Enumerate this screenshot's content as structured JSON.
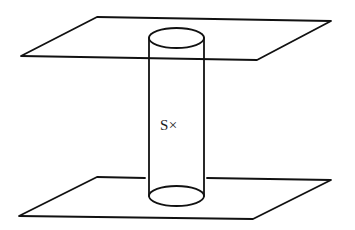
{
  "diagram": {
    "type": "geometric-illustration",
    "label": "S×",
    "stroke_color": "#111111",
    "background": "#ffffff",
    "elements": {
      "top_plane": {
        "points": [
          [
            21,
            56
          ],
          [
            97,
            17
          ],
          [
            331,
            21
          ],
          [
            257,
            60
          ]
        ]
      },
      "bottom_plane": {
        "points": [
          [
            19,
            216
          ],
          [
            97,
            177
          ],
          [
            331,
            180
          ],
          [
            253,
            219
          ]
        ]
      },
      "cylinder": {
        "left_x": 149,
        "right_x": 204,
        "top_ellipse": {
          "cx": 176.5,
          "cy": 38,
          "rx": 27.5,
          "ry": 10
        },
        "bottom_ellipse": {
          "cx": 176.5,
          "cy": 196,
          "rx": 27.5,
          "ry": 10
        }
      }
    }
  }
}
